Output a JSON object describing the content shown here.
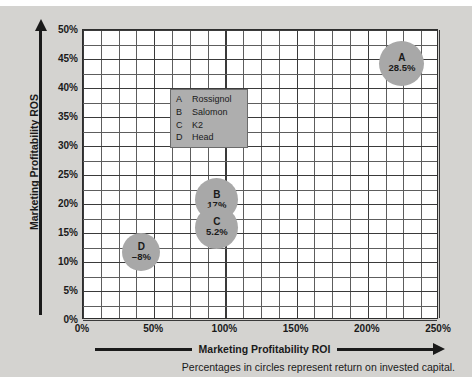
{
  "chart_data": {
    "type": "scatter",
    "title": "",
    "xlabel": "Marketing Profitability ROI",
    "ylabel": "Marketing Profitability ROS",
    "xlim": [
      0,
      250
    ],
    "ylim": [
      0,
      50
    ],
    "xticks": [
      "0%",
      "50%",
      "100%",
      "150%",
      "200%",
      "250%"
    ],
    "xtick_values": [
      0,
      50,
      100,
      150,
      200,
      250
    ],
    "yticks": [
      "0%",
      "5%",
      "10%",
      "15%",
      "20%",
      "25%",
      "30%",
      "35%",
      "40%",
      "45%",
      "50%"
    ],
    "ytick_values": [
      0,
      5,
      10,
      15,
      20,
      25,
      30,
      35,
      40,
      45,
      50
    ],
    "grid": true,
    "grid_minor_x_step": 12.5,
    "grid_minor_y_step": 2.5,
    "bubble_value_label": "return on invested capital",
    "points": [
      {
        "id": "A",
        "name": "Rossignol",
        "x": 224,
        "y": 44.3,
        "value": "28.5%",
        "size": 45
      },
      {
        "id": "B",
        "name": "Salomon",
        "x": 94,
        "y": 20.7,
        "value": "17%",
        "size": 43
      },
      {
        "id": "C",
        "name": "K2",
        "x": 94,
        "y": 16.0,
        "value": "5.2%",
        "size": 43
      },
      {
        "id": "D",
        "name": "Head",
        "x": 41,
        "y": 11.7,
        "value": "–8%",
        "size": 38
      }
    ],
    "legend": {
      "position": "upper-left-inside",
      "entries": [
        {
          "key": "A",
          "name": "Rossignol"
        },
        {
          "key": "B",
          "name": "Salomon"
        },
        {
          "key": "C",
          "name": "K2"
        },
        {
          "key": "D",
          "name": "Head"
        }
      ]
    },
    "caption": "Percentages in circles represent return on invested capital.",
    "colors": {
      "figure_background": "#d4d3d0",
      "plot_background": "#ffffff",
      "bubble_fill": "#a8a8a8",
      "legend_fill": "#aeaeae",
      "axis": "#1a1a1a",
      "grid": "#5d5d5d"
    }
  }
}
